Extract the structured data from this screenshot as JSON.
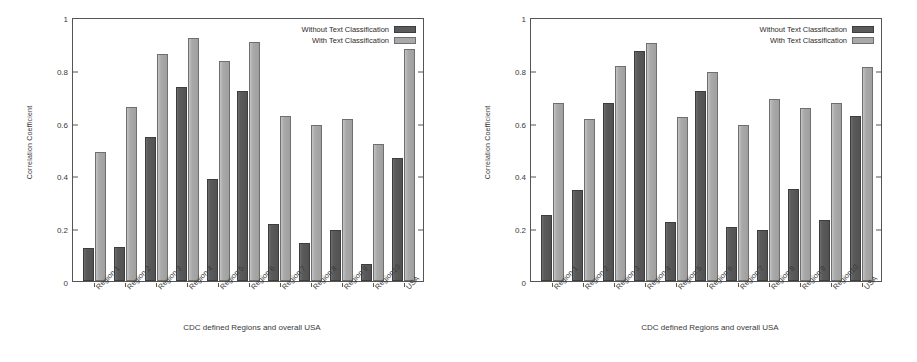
{
  "figure": {
    "panels": [
      {
        "name": "left-chart",
        "chart_data": {
          "type": "bar",
          "title": "",
          "xlabel": "CDC defined Regions and overall USA",
          "ylabel": "Correlation Coefficient",
          "ylim": [
            0,
            1
          ],
          "yticks": [
            "0",
            "0.2",
            "0.4",
            "0.6",
            "0.8",
            "1"
          ],
          "ytick_values": [
            0,
            0.2,
            0.4,
            0.6,
            0.8,
            1
          ],
          "grid": false,
          "legend_position": "top-right",
          "categories": [
            "Region 1",
            "Region 2",
            "Region 3",
            "Region 4",
            "Region 5",
            "Region 6",
            "Region 7",
            "Region 8",
            "Region 9",
            "Region10",
            "USA"
          ],
          "series": [
            {
              "name": "Without Text Classification",
              "color": "#5b5b5b",
              "values": [
                0.125,
                0.13,
                0.545,
                0.735,
                0.385,
                0.72,
                0.215,
                0.145,
                0.195,
                0.065,
                0.465
              ]
            },
            {
              "name": "With Text Classification",
              "color": "#a9a9a9",
              "values": [
                0.49,
                0.66,
                0.86,
                0.92,
                0.835,
                0.905,
                0.625,
                0.59,
                0.615,
                0.52,
                0.88
              ]
            }
          ]
        }
      },
      {
        "name": "right-chart",
        "chart_data": {
          "type": "bar",
          "title": "",
          "xlabel": "CDC defined Regions and overall USA",
          "ylabel": "Correlation Coefficient",
          "ylim": [
            0,
            1
          ],
          "yticks": [
            "0",
            "0.2",
            "0.4",
            "0.6",
            "0.8",
            "1"
          ],
          "ytick_values": [
            0,
            0.2,
            0.4,
            0.6,
            0.8,
            1
          ],
          "grid": false,
          "legend_position": "top-right",
          "categories": [
            "Region 1",
            "Region 2",
            "Region 3",
            "Region 4",
            "Region 5",
            "Region 6",
            "Region 7",
            "Region 8",
            "Region 9",
            "Region10",
            "USA"
          ],
          "series": [
            {
              "name": "Without Text Classification",
              "color": "#5b5b5b",
              "values": [
                0.25,
                0.345,
                0.675,
                0.87,
                0.225,
                0.72,
                0.205,
                0.195,
                0.35,
                0.23,
                0.625
              ]
            },
            {
              "name": "With Text Classification",
              "color": "#a9a9a9",
              "values": [
                0.675,
                0.615,
                0.815,
                0.9,
                0.62,
                0.79,
                0.59,
                0.69,
                0.655,
                0.675,
                0.81
              ]
            }
          ]
        }
      }
    ]
  },
  "colors": {
    "without": "#5b5b5b",
    "with": "#a9a9a9",
    "axis": "#555555",
    "background": "#ffffff"
  }
}
